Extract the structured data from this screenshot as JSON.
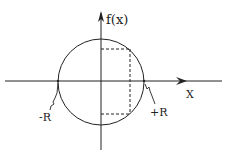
{
  "diagram": {
    "type": "circle-with-inscribed-rectangle",
    "axes": {
      "x_label": "X",
      "y_label": "f(x)"
    },
    "points": {
      "left_intercept_label": "-R",
      "right_intercept_label": "+R"
    },
    "colors": {
      "stroke": "#222222",
      "background": "#ffffff"
    }
  }
}
